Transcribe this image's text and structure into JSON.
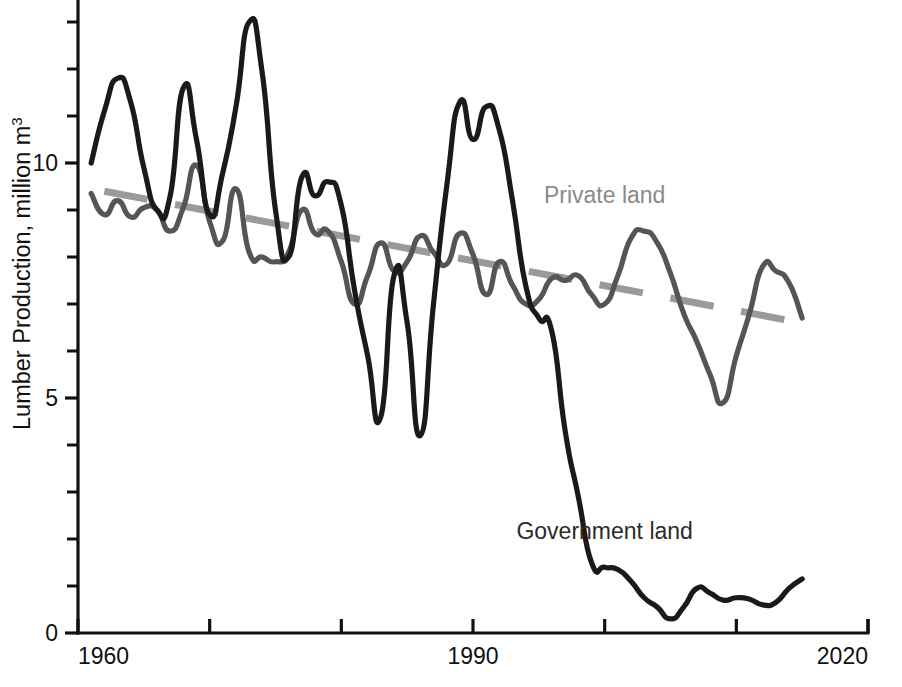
{
  "chart_data": {
    "type": "line",
    "title": "",
    "xlabel": "",
    "ylabel": "Lumber Production, million m3",
    "ylabel_parts": {
      "main": "Lumber Production, million m",
      "superscript": "3"
    },
    "xlim": [
      1960,
      2020
    ],
    "ylim": [
      0,
      13.6
    ],
    "grid": false,
    "legend_position": "inline-annotations",
    "x_ticks": [
      1960,
      1970,
      1980,
      1990,
      2000,
      2010,
      2020
    ],
    "x_tick_labels_shown": [
      "1960",
      "1990",
      "2020"
    ],
    "x_tick_label_values": [
      1960,
      1990,
      2020
    ],
    "y_ticks": [
      0,
      1,
      2,
      3,
      4,
      5,
      6,
      7,
      8,
      9,
      10,
      11,
      12,
      13
    ],
    "y_tick_labels_shown": [
      "0",
      "5",
      "10"
    ],
    "y_tick_label_values": [
      0,
      5,
      10
    ],
    "colors": {
      "government": "#1a1a1a",
      "private": "#555555",
      "trend": "#9a9a9a",
      "axis": "#111111",
      "background": "#ffffff"
    },
    "annotations": [
      {
        "text": "Private land",
        "x": 2000,
        "y": 9.15,
        "color": "#8a8a8a"
      },
      {
        "text": "Government land",
        "x": 2000,
        "y": 2.0,
        "color": "#2a2a2a"
      }
    ],
    "series": [
      {
        "name": "Government land",
        "color": "#1a1a1a",
        "style": "solid",
        "x": [
          1961,
          1962,
          1963,
          1964,
          1965,
          1966,
          1967,
          1968,
          1969,
          1970,
          1971,
          1972,
          1973,
          1974,
          1975,
          1976,
          1977,
          1978,
          1979,
          1980,
          1981,
          1982,
          1983,
          1984,
          1985,
          1986,
          1987,
          1988,
          1989,
          1990,
          1991,
          1992,
          1993,
          1994,
          1995,
          1996,
          1997,
          1998,
          1999,
          2000,
          2001,
          2002,
          2003,
          2004,
          2005,
          2006,
          2007,
          2008,
          2009,
          2010,
          2011,
          2012,
          2013,
          2014,
          2015
        ],
        "values": [
          10.0,
          11.1,
          11.8,
          11.3,
          9.9,
          9.0,
          9.3,
          11.6,
          10.5,
          8.9,
          9.8,
          11.2,
          13.0,
          11.9,
          9.0,
          8.0,
          9.7,
          9.3,
          9.6,
          9.1,
          7.3,
          5.9,
          4.6,
          7.6,
          6.6,
          4.2,
          7.0,
          9.5,
          11.3,
          10.5,
          11.2,
          10.7,
          9.2,
          7.4,
          6.7,
          6.4,
          4.3,
          2.9,
          1.5,
          1.4,
          1.35,
          1.1,
          0.75,
          0.55,
          0.3,
          0.55,
          0.95,
          0.85,
          0.7,
          0.75,
          0.72,
          0.6,
          0.65,
          0.95,
          1.15
        ]
      },
      {
        "name": "Private land",
        "color": "#555555",
        "style": "solid",
        "x": [
          1961,
          1962,
          1963,
          1964,
          1965,
          1966,
          1967,
          1968,
          1969,
          1970,
          1971,
          1972,
          1973,
          1974,
          1975,
          1976,
          1977,
          1978,
          1979,
          1980,
          1981,
          1982,
          1983,
          1984,
          1985,
          1986,
          1987,
          1988,
          1989,
          1990,
          1991,
          1992,
          1993,
          1994,
          1995,
          1996,
          1997,
          1998,
          1999,
          2000,
          2001,
          2002,
          2003,
          2004,
          2005,
          2006,
          2007,
          2008,
          2009,
          2010,
          2011,
          2012,
          2013,
          2014,
          2015
        ],
        "values": [
          9.35,
          8.9,
          9.2,
          8.85,
          9.05,
          9.0,
          8.55,
          9.05,
          9.95,
          8.75,
          8.35,
          9.45,
          8.1,
          8.0,
          7.9,
          8.1,
          9.0,
          8.5,
          8.55,
          7.9,
          7.0,
          7.6,
          8.3,
          7.7,
          7.9,
          8.45,
          8.1,
          7.85,
          8.5,
          8.05,
          7.2,
          7.9,
          7.4,
          7.0,
          7.1,
          7.55,
          7.5,
          7.6,
          7.2,
          7.0,
          7.6,
          8.4,
          8.55,
          8.3,
          7.65,
          6.8,
          6.2,
          5.5,
          4.9,
          5.9,
          6.8,
          7.8,
          7.7,
          7.45,
          6.7
        ]
      }
    ],
    "trend_line": {
      "name": "Private land trend",
      "style": "dashed",
      "color": "#9a9a9a",
      "x": [
        1962,
        2014
      ],
      "values": [
        9.4,
        6.65
      ]
    }
  }
}
